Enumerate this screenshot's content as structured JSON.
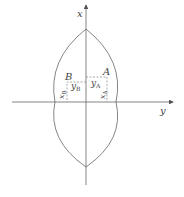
{
  "diagram": {
    "axes": {
      "vertical_label": "x",
      "horizontal_label": "y"
    },
    "points": [
      {
        "name": "A",
        "x_label": "x",
        "x_sub": "A",
        "y_label": "y",
        "y_sub": "A"
      },
      {
        "name": "B",
        "x_label": "x",
        "x_sub": "B",
        "y_label": "y",
        "y_sub": "B"
      }
    ],
    "colors": {
      "stroke": "#555555",
      "dashed": "#777777"
    }
  }
}
